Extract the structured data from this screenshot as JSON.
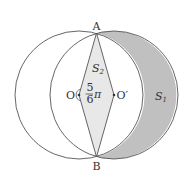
{
  "figure": {
    "points": {
      "A": {
        "label": "A",
        "x": 96.5,
        "y": 33
      },
      "B": {
        "label": "B",
        "x": 96.5,
        "y": 157
      },
      "O": {
        "label": "O",
        "x": 79,
        "y": 95
      },
      "O_prime": {
        "label": "O′",
        "x": 114,
        "y": 95
      }
    },
    "circles": [
      {
        "name": "circle-O",
        "center": "O",
        "radius": 64
      },
      {
        "name": "circle-O-prime",
        "center": "O′",
        "radius": 64
      }
    ],
    "regions": {
      "S1": {
        "label_main": "S",
        "label_sub": "1",
        "fill": "#c0c0c0",
        "description": "crescent of circle O′ outside circle O"
      },
      "S2": {
        "label_main": "S",
        "label_sub": "2",
        "fill": "#e8e8e8",
        "description": "rhombus AOBO′"
      }
    },
    "angle": {
      "numerator": "5",
      "denominator": "6",
      "symbol": "π",
      "at": "O"
    },
    "stroke_color": "#555555"
  }
}
